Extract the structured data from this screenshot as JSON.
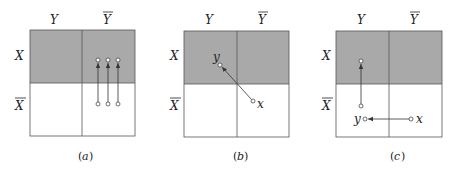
{
  "colors": {
    "shaded": "#a9a9a9",
    "unshaded": "#ffffff",
    "border": "#555555",
    "arrow": "#333333"
  },
  "labels": {
    "col_y": "Y",
    "col_ybar": "Y",
    "row_x": "X",
    "row_xbar": "X",
    "point_x": "x",
    "point_y": "y"
  },
  "panels": [
    {
      "id": "a",
      "caption": "(a)",
      "caption_letter": "a",
      "description": "Three vertical arrows in the Y-bar column pointing from the X-bar row up into the X row",
      "arrows": [
        {
          "from": [
            98,
            104
          ],
          "to": [
            98,
            60
          ]
        },
        {
          "from": [
            108,
            104
          ],
          "to": [
            108,
            60
          ]
        },
        {
          "from": [
            118,
            104
          ],
          "to": [
            118,
            60
          ]
        }
      ]
    },
    {
      "id": "b",
      "caption": "(b)",
      "caption_letter": "b",
      "description": "Diagonal arrow from point x in (X-bar, Y-bar) to point y in (X, Y)",
      "arrows": [
        {
          "from": [
            253,
            101
          ],
          "to": [
            220,
            65
          ],
          "from_label": "x",
          "to_label": "y"
        }
      ]
    },
    {
      "id": "c",
      "caption": "(c)",
      "caption_letter": "c",
      "description": "Horizontal arrow from x in (X-bar, Y-bar) to y in (X-bar, Y), then vertical arrow up into (X, Y)",
      "arrows": [
        {
          "from": [
            411,
            119
          ],
          "to": [
            365,
            119
          ],
          "from_label": "x",
          "to_label": "y"
        },
        {
          "from": [
            361,
            106
          ],
          "to": [
            361,
            61
          ]
        }
      ]
    }
  ]
}
